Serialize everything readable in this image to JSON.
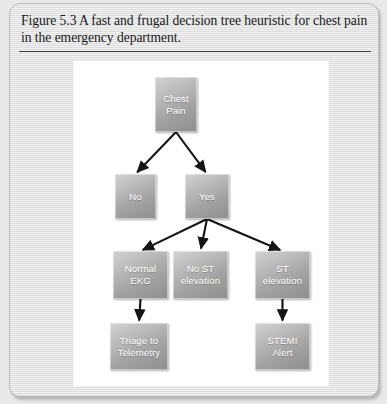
{
  "figure": {
    "caption": "Figure 5.3 A fast and frugal decision tree heuristic for chest pain in the emergency department."
  },
  "diagram": {
    "type": "decision-tree",
    "nodes": [
      {
        "id": "chest-pain",
        "label": "Chest\nPain",
        "x": 81,
        "y": 16,
        "w": 42,
        "h": 55
      },
      {
        "id": "no",
        "label": "No",
        "x": 41,
        "y": 113,
        "w": 41,
        "h": 45
      },
      {
        "id": "yes",
        "label": "Yes",
        "x": 111,
        "y": 113,
        "w": 44,
        "h": 45
      },
      {
        "id": "normal-ekg",
        "label": "Normal\nEKG",
        "x": 39,
        "y": 190,
        "w": 55,
        "h": 48
      },
      {
        "id": "no-st-elevation",
        "label": "No ST\nelevation",
        "x": 99,
        "y": 190,
        "w": 55,
        "h": 48
      },
      {
        "id": "st-elevation",
        "label": "ST\nelevation",
        "x": 181,
        "y": 190,
        "w": 55,
        "h": 48
      },
      {
        "id": "triage",
        "label": "Triage to\nTelemetry",
        "x": 36,
        "y": 262,
        "w": 58,
        "h": 47
      },
      {
        "id": "stemi-alert",
        "label": "STEMI\nAlert",
        "x": 181,
        "y": 262,
        "w": 55,
        "h": 47
      }
    ],
    "edges": [
      {
        "from": "chest-pain",
        "to": "no"
      },
      {
        "from": "chest-pain",
        "to": "yes"
      },
      {
        "from": "yes",
        "to": "normal-ekg"
      },
      {
        "from": "yes",
        "to": "no-st-elevation"
      },
      {
        "from": "yes",
        "to": "st-elevation"
      },
      {
        "from": "normal-ekg",
        "to": "triage"
      },
      {
        "from": "st-elevation",
        "to": "stemi-alert"
      }
    ],
    "colors": {
      "node_light": "#d2d2d2",
      "node_dark": "#8e8e8e",
      "node_text": "#ffffff",
      "arrow": "#151515",
      "canvas": "#ffffff",
      "card": "#e4e4e4"
    }
  }
}
